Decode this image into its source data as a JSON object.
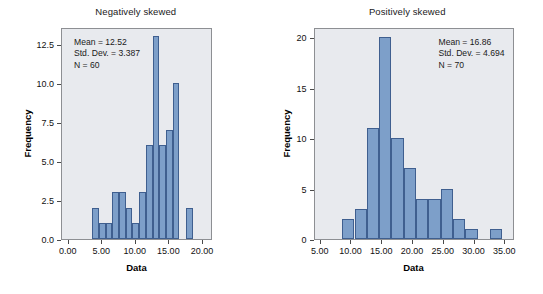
{
  "figure": {
    "background_color": "#ffffff",
    "plot_background_color": "#e8eaee",
    "bar_fill_color": "#7d9fc9",
    "bar_edge_color": "#3f5f8f"
  },
  "chart_data": [
    {
      "type": "bar",
      "title": "Negatively skewed",
      "xlabel": "Data",
      "ylabel": "Frequency",
      "xlim": [
        -1.0,
        21.5
      ],
      "ylim": [
        0,
        13.6
      ],
      "grid": false,
      "legend": null,
      "xticks": [
        0,
        5,
        10,
        15,
        20
      ],
      "xtick_labels": [
        "0.00",
        "5.00",
        "10.00",
        "15.00",
        "20.00"
      ],
      "yticks": [
        0,
        2.5,
        5,
        7.5,
        10,
        12.5
      ],
      "ytick_labels": [
        "0.0",
        "2.5",
        "5.0",
        "7.5",
        "10.0",
        "12.5"
      ],
      "bin_width": 1,
      "bin_starts": [
        3.5,
        4.5,
        5.5,
        6.5,
        7.5,
        8.5,
        9.5,
        10.5,
        11.5,
        12.5,
        13.5,
        14.5,
        15.5,
        16.5,
        17.5
      ],
      "values": [
        2,
        1,
        1,
        3,
        3,
        2,
        1,
        3,
        6,
        13,
        6,
        7,
        10,
        0,
        2
      ],
      "annotations": {
        "mean_label": "Mean = 12.52",
        "std_label": "Std. Dev. = 3.387",
        "n_label": "N = 60",
        "mean": 12.52,
        "std_dev": 3.387,
        "n": 60,
        "position": "top-left"
      }
    },
    {
      "type": "bar",
      "title": "Positively skewed",
      "xlabel": "Data",
      "ylabel": "Frequency",
      "xlim": [
        4.0,
        36.5
      ],
      "ylim": [
        0,
        21.0
      ],
      "grid": false,
      "legend": null,
      "xticks": [
        5,
        10,
        15,
        20,
        25,
        30,
        35
      ],
      "xtick_labels": [
        "5.00",
        "10.00",
        "15.00",
        "20.00",
        "25.00",
        "30.00",
        "35.00"
      ],
      "yticks": [
        0,
        5,
        10,
        15,
        20
      ],
      "ytick_labels": [
        "0",
        "5",
        "10",
        "15",
        "20"
      ],
      "bin_width": 2,
      "bin_starts": [
        8.5,
        10.5,
        12.5,
        14.5,
        16.5,
        18.5,
        20.5,
        22.5,
        24.5,
        26.5,
        28.5,
        30.5,
        32.5
      ],
      "values": [
        2,
        3,
        11,
        20,
        10,
        7,
        4,
        4,
        5,
        2,
        1,
        0,
        1
      ],
      "annotations": {
        "mean_label": "Mean = 16.86",
        "std_label": "Std. Dev. = 4.694",
        "n_label": "N = 70",
        "mean": 16.86,
        "std_dev": 4.694,
        "n": 70,
        "position": "top-right"
      }
    }
  ]
}
